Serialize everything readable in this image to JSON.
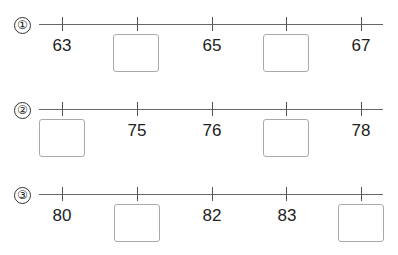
{
  "exercises": [
    {
      "number": "①",
      "ticks": [
        {
          "value": "63",
          "blank": false
        },
        {
          "value": "",
          "blank": true
        },
        {
          "value": "65",
          "blank": false
        },
        {
          "value": "",
          "blank": true
        },
        {
          "value": "67",
          "blank": false
        }
      ]
    },
    {
      "number": "②",
      "ticks": [
        {
          "value": "",
          "blank": true
        },
        {
          "value": "75",
          "blank": false
        },
        {
          "value": "76",
          "blank": false
        },
        {
          "value": "",
          "blank": true
        },
        {
          "value": "78",
          "blank": false
        }
      ]
    },
    {
      "number": "③",
      "ticks": [
        {
          "value": "80",
          "blank": false
        },
        {
          "value": "",
          "blank": true
        },
        {
          "value": "82",
          "blank": false
        },
        {
          "value": "83",
          "blank": false
        },
        {
          "value": "",
          "blank": true
        }
      ]
    }
  ]
}
